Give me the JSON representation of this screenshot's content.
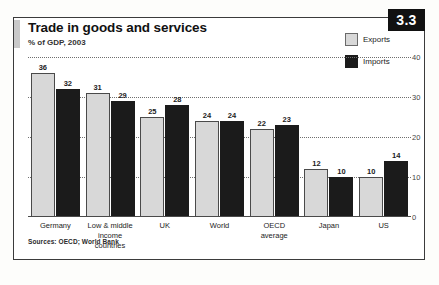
{
  "figure": {
    "badge": "3.3",
    "title": "Trade in goods and services",
    "subtitle": "% of GDP, 2003",
    "source": "Sources: OECD; World Bank"
  },
  "legend": {
    "items": [
      {
        "label": "Exports",
        "swatch": "light-gray",
        "color": "#d8d8d8"
      },
      {
        "label": "Imports",
        "swatch": "black",
        "color": "#1b1b1b"
      }
    ]
  },
  "chart_data": {
    "type": "bar",
    "title": "Trade in goods and services",
    "subtitle": "% of GDP, 2003",
    "xlabel": "",
    "ylabel": "% of GDP",
    "ylim": [
      0,
      40
    ],
    "yticks": [
      0,
      10,
      20,
      30,
      40
    ],
    "ytick_labels": [
      "0",
      "10",
      "20",
      "30",
      "40"
    ],
    "grid": true,
    "grid_style": "dotted-horizontal",
    "axis_position": "right",
    "legend_position": "top-right",
    "categories": [
      "Germany",
      "Low & middle income countries",
      "UK",
      "World",
      "OECD average",
      "Japan",
      "US"
    ],
    "category_lines": [
      [
        "Germany"
      ],
      [
        "Low & middle",
        "income countries"
      ],
      [
        "UK"
      ],
      [
        "World"
      ],
      [
        "OECD",
        "average"
      ],
      [
        "Japan"
      ],
      [
        "US"
      ]
    ],
    "series": [
      {
        "name": "Exports",
        "color": "#d8d8d8",
        "values": [
          36,
          31,
          25,
          24,
          22,
          12,
          10
        ]
      },
      {
        "name": "Imports",
        "color": "#1b1b1b",
        "values": [
          32,
          29,
          28,
          24,
          23,
          10,
          14
        ]
      }
    ],
    "source": "Sources: OECD; World Bank"
  }
}
